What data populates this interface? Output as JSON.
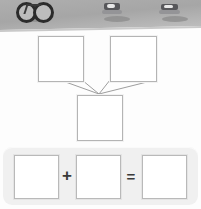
{
  "photo_strip": {
    "name": "thumbnail-strip",
    "background_color": "#a8a8a8",
    "thumbnails": [
      {
        "icon": "bicycle-icon",
        "label": "bicycle"
      },
      {
        "icon": "vehicle-icon",
        "label": "vehicle"
      },
      {
        "icon": "vehicle-icon",
        "label": "vehicle"
      }
    ]
  },
  "diagram": {
    "name": "combination-diagram",
    "box_a": "",
    "box_b": "",
    "box_c": "",
    "connector": "two-to-one"
  },
  "equation": {
    "name": "addition-equation",
    "panel_color": "#f0f0f0",
    "operand_1": "",
    "plus_symbol": "+",
    "operand_2": "",
    "equals_symbol": "=",
    "result": ""
  }
}
